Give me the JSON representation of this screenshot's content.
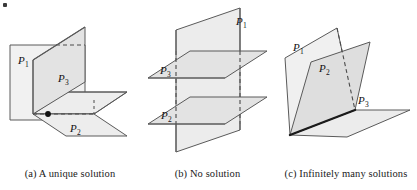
{
  "figure": {
    "panel_count": 3
  },
  "colors": {
    "plane_light": "#f1f1f1",
    "plane_mid": "#e3e3e3",
    "plane_dark": "#d6d6d6",
    "outline": "#5a5a5a",
    "outline_strong": "#3c3c3c",
    "dash": "#4a4a4a",
    "text": "#1a1a1a",
    "background": "#ffffff",
    "intersection_line": "#1b1b1b",
    "point": "#111111"
  },
  "panels": [
    {
      "id": "a",
      "caption": "(a) A unique solution",
      "labels": [
        {
          "name": "P1",
          "base": "P",
          "sub": "1",
          "x": 20,
          "y": 60
        },
        {
          "name": "P3",
          "base": "P",
          "sub": "3",
          "x": 62,
          "y": 78
        },
        {
          "name": "P2",
          "base": "P",
          "sub": "2",
          "x": 74,
          "y": 130
        }
      ],
      "features": [
        "vertical-plane-P1",
        "vertical-plane-P3",
        "horizontal-plane-P2",
        "intersection-point",
        "hidden-dashed-edges"
      ]
    },
    {
      "id": "b",
      "caption": "(b) No solution",
      "labels": [
        {
          "name": "P1",
          "base": "P",
          "sub": "1",
          "x": 100,
          "y": 22
        },
        {
          "name": "P3",
          "base": "P",
          "sub": "3",
          "x": 20,
          "y": 72
        },
        {
          "name": "P2",
          "base": "P",
          "sub": "2",
          "x": 21,
          "y": 117
        }
      ],
      "features": [
        "vertical-plane-P1",
        "horizontal-plane-P3",
        "horizontal-plane-P2",
        "parallel-planes",
        "hidden-dashed-edges"
      ]
    },
    {
      "id": "c",
      "caption": "(c) Infinitely many solutions",
      "labels": [
        {
          "name": "P1",
          "base": "P",
          "sub": "1",
          "x": 20,
          "y": 47
        },
        {
          "name": "P2",
          "base": "P",
          "sub": "2",
          "x": 46,
          "y": 68
        },
        {
          "name": "P3",
          "base": "P",
          "sub": "3",
          "x": 84,
          "y": 100
        }
      ],
      "features": [
        "plane-P1",
        "plane-P2",
        "plane-P3",
        "common-line-of-intersection",
        "hidden-dashed-edge"
      ]
    }
  ]
}
